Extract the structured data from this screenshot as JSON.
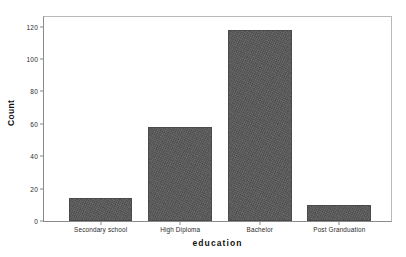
{
  "chart_data": {
    "type": "bar",
    "title": "",
    "subtitle": "",
    "xlabel": "education",
    "ylabel": "Count",
    "categories": [
      "Secondary school",
      "High Diploma",
      "Bachelor",
      "Post Granduation"
    ],
    "values": [
      14,
      58,
      118,
      10
    ],
    "series": [
      {
        "name": "Count",
        "values": [
          14,
          58,
          118,
          10
        ]
      }
    ],
    "ylim": [
      0,
      126
    ],
    "yticks": [
      0,
      20,
      40,
      60,
      80,
      100,
      120
    ],
    "ytick_labels": [
      "0",
      "20",
      "40",
      "60",
      "80",
      "100",
      "120"
    ],
    "grid": false,
    "legend": false,
    "legend_position": "none",
    "bar_color": "#575757",
    "bar_edge_color": "#4a4a4a",
    "axis_color": "#8a8a8a",
    "background_color": "#ffffff",
    "annotations": []
  },
  "figure": {
    "y_axis_title": "Count",
    "x_axis_title": "education"
  }
}
